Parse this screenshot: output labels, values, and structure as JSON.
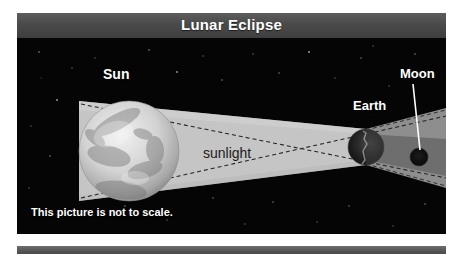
{
  "figure": {
    "title": "Lunar Eclipse",
    "caption": "This picture is not to scale."
  },
  "labels": {
    "sun": "Sun",
    "earth": "Earth",
    "moon": "Moon",
    "sunlight": "sunlight"
  },
  "colors": {
    "title_bar": "#4a4a4a",
    "sky": "#050505",
    "sunlight_band": "#c9c9c9",
    "penumbra": "#8c8c8c",
    "umbra": "#6a6a6a",
    "sun_body": "#d8d8d8",
    "earth_body": "#222222",
    "moon_body": "#0d0d0d",
    "ray_line": "#2b2b2b",
    "leader_line": "#ffffff",
    "bottom_bar": "#555555"
  },
  "diagram": {
    "type": "astronomy-schematic",
    "bodies": [
      {
        "name": "sun",
        "cx": 112,
        "cy": 113,
        "r": 50,
        "label": "Sun"
      },
      {
        "name": "earth",
        "cx": 349,
        "cy": 109,
        "r": 18,
        "label": "Earth"
      },
      {
        "name": "moon",
        "cx": 402,
        "cy": 119,
        "r": 9,
        "label": "Moon"
      }
    ],
    "regions": [
      {
        "name": "sunlight-band",
        "label": "sunlight"
      },
      {
        "name": "penumbra"
      },
      {
        "name": "umbra"
      }
    ],
    "rays": [
      {
        "name": "tangent-ray-upper",
        "style": "dashed"
      },
      {
        "name": "tangent-ray-lower",
        "style": "dashed"
      },
      {
        "name": "shadow-edge-upper",
        "style": "dashed"
      },
      {
        "name": "shadow-edge-lower",
        "style": "dashed"
      }
    ]
  }
}
